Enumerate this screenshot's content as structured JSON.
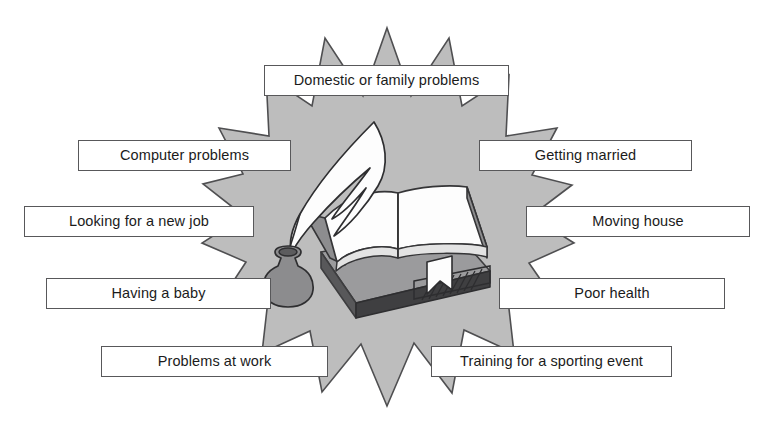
{
  "figure": {
    "type": "starburst-diagram",
    "cut_off_heading": "",
    "center_illustration": "open-book-with-quill-and-inkwell",
    "colors": {
      "burst_fill": "#bdbdbd",
      "burst_stroke": "#4f4f51",
      "label_fill": "#ffffff",
      "label_stroke": "#58585a",
      "text": "#1b1b1b",
      "book_dark": "#4d4d4f",
      "book_mid": "#9a9a9c",
      "page_white": "#fdfdfd",
      "ink_grey": "#8c8c8e",
      "background": "#ffffff"
    }
  },
  "labels": [
    {
      "id": "domestic-or-family-problems",
      "text": "Domestic or family problems",
      "x": 264,
      "y": 65,
      "w": 245,
      "h": 31
    },
    {
      "id": "computer-problems",
      "text": "Computer problems",
      "x": 78,
      "y": 140,
      "w": 213,
      "h": 31
    },
    {
      "id": "getting-married",
      "text": "Getting married",
      "x": 479,
      "y": 140,
      "w": 213,
      "h": 31
    },
    {
      "id": "looking-for-a-new-job",
      "text": "Looking for a new job",
      "x": 24,
      "y": 206,
      "w": 230,
      "h": 31
    },
    {
      "id": "moving-house",
      "text": "Moving house",
      "x": 526,
      "y": 206,
      "w": 224,
      "h": 31
    },
    {
      "id": "having-a-baby",
      "text": "Having a baby",
      "x": 46,
      "y": 278,
      "w": 225,
      "h": 31
    },
    {
      "id": "poor-health",
      "text": "Poor health",
      "x": 499,
      "y": 278,
      "w": 226,
      "h": 31
    },
    {
      "id": "problems-at-work",
      "text": "Problems at work",
      "x": 101,
      "y": 346,
      "w": 227,
      "h": 31
    },
    {
      "id": "training-for-a-sporting-event",
      "text": "Training for a sporting event",
      "x": 431,
      "y": 346,
      "w": 241,
      "h": 31
    }
  ]
}
